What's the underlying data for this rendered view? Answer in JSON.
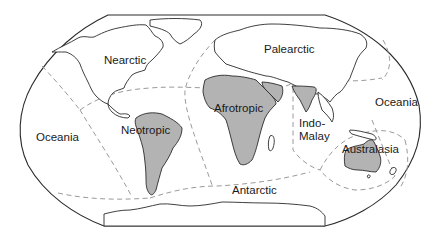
{
  "map": {
    "title": "Biogeographic realms",
    "projection_shape": "winkel-tripel-like",
    "colors": {
      "background": "#ffffff",
      "outline": "#2a2a2a",
      "highlighted_land": "#b3b3b3",
      "realm_boundary": "#9a9a9a"
    },
    "highlighted_regions": [
      "Neotropic",
      "Afrotropic",
      "Australasia",
      "Indian subcontinent (Indo-Malay)"
    ],
    "labels": {
      "nearctic": "Nearctic",
      "palearctic": "Palearctic",
      "afrotropic": "Afrotropic",
      "neotropic": "Neotropic",
      "indo_malay": "Indo-\nMalay",
      "oceania_west": "Oceania",
      "oceania_east": "Oceania",
      "australasia": "Australasia",
      "antarctic": "Antarctic"
    }
  }
}
